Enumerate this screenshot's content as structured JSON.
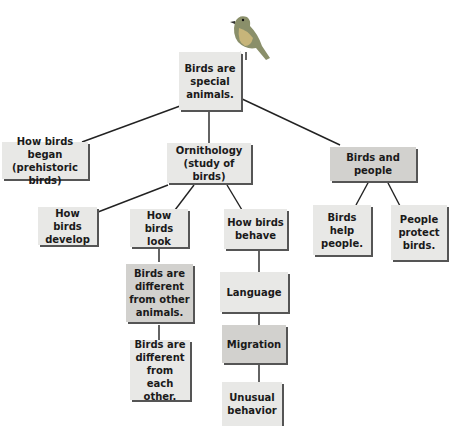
{
  "diagram": {
    "type": "concept-map",
    "root": {
      "label": "Birds are special animals."
    },
    "nodes": [
      {
        "id": "root",
        "label": "Birds are\nspecial\nanimals."
      },
      {
        "id": "began",
        "label": "How birds began\n(prehistoric birds)"
      },
      {
        "id": "ornithology",
        "label": "Ornithology\n(study of birds)"
      },
      {
        "id": "people",
        "label": "Birds and people"
      },
      {
        "id": "develop",
        "label": "How birds\ndevelop"
      },
      {
        "id": "look",
        "label": "How birds\nlook"
      },
      {
        "id": "behave",
        "label": "How birds\nbehave"
      },
      {
        "id": "help",
        "label": "Birds\nhelp\npeople."
      },
      {
        "id": "protect",
        "label": "People\nprotect\nbirds."
      },
      {
        "id": "diffother",
        "label": "Birds are\ndifferent\nfrom other\nanimals."
      },
      {
        "id": "diffeach",
        "label": "Birds are\ndifferent\nfrom each\nother."
      },
      {
        "id": "language",
        "label": "Language"
      },
      {
        "id": "migration",
        "label": "Migration"
      },
      {
        "id": "unusual",
        "label": "Unusual\nbehavior"
      }
    ],
    "edges": [
      [
        "root",
        "began"
      ],
      [
        "root",
        "ornithology"
      ],
      [
        "root",
        "people"
      ],
      [
        "ornithology",
        "develop"
      ],
      [
        "ornithology",
        "look"
      ],
      [
        "ornithology",
        "behave"
      ],
      [
        "people",
        "help"
      ],
      [
        "people",
        "protect"
      ],
      [
        "look",
        "diffother"
      ],
      [
        "diffother",
        "diffeach"
      ],
      [
        "behave",
        "language"
      ],
      [
        "language",
        "migration"
      ],
      [
        "migration",
        "unusual"
      ]
    ],
    "decoration": "bird-illustration"
  },
  "labels": {
    "root": "Birds are special animals.",
    "began": "How birds began (prehistoric birds)",
    "ornithology": "Ornithology (study of birds)",
    "people": "Birds and people",
    "develop": "How birds develop",
    "look": "How birds look",
    "behave": "How birds behave",
    "help": "Birds help people.",
    "protect": "People protect birds.",
    "diffother": "Birds are different from other animals.",
    "diffeach": "Birds are different from each other.",
    "language": "Language",
    "migration": "Migration",
    "unusual": "Unusual behavior"
  }
}
